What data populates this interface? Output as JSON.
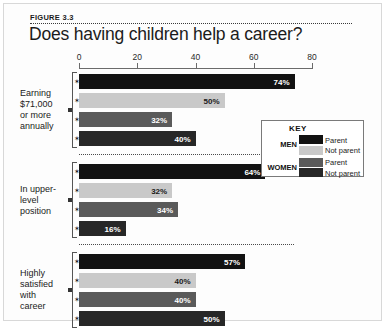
{
  "figure": {
    "number_label": "FIGURE 3.3",
    "title": "Does having children help a career?"
  },
  "key": {
    "title": "KEY",
    "groups": [
      {
        "label": "MEN",
        "entries": [
          {
            "text": "Parent",
            "color": "#121212"
          },
          {
            "text": "Not parent",
            "color": "#c9c9c9"
          }
        ]
      },
      {
        "label": "WOMEN",
        "entries": [
          {
            "text": "Parent",
            "color": "#5a5a5a"
          },
          {
            "text": "Not parent",
            "color": "#272727"
          }
        ]
      }
    ]
  },
  "chart_data": {
    "type": "bar",
    "title": "Does having children help a career?",
    "orientation": "horizontal",
    "xlabel": "",
    "ylabel": "",
    "xlim": [
      0,
      80
    ],
    "xticks": [
      0,
      20,
      40,
      60,
      80
    ],
    "xtick_labels": [
      "0",
      "20",
      "40",
      "60",
      "80"
    ],
    "grid": false,
    "legend_position": "right-middle",
    "value_suffix": "%",
    "categories": [
      "Earning $71,000 or more annually",
      "In upper-level position",
      "Highly satisfied with career"
    ],
    "category_labels_wrapped": [
      "Earning\n$71,000\nor more\nannually",
      "In upper-\nlevel\nposition",
      "Highly\nsatisfied\nwith\ncareer"
    ],
    "series": [
      {
        "name": "Men Parent",
        "color": "#121212",
        "label_color": "#ffffff",
        "values": [
          74,
          64,
          57
        ]
      },
      {
        "name": "Men Not parent",
        "color": "#c9c9c9",
        "label_color": "#1a1a1a",
        "values": [
          50,
          32,
          40
        ]
      },
      {
        "name": "Women Parent",
        "color": "#5a5a5a",
        "label_color": "#ffffff",
        "values": [
          32,
          34,
          40
        ]
      },
      {
        "name": "Women Not parent",
        "color": "#272727",
        "label_color": "#ffffff",
        "values": [
          40,
          16,
          50
        ]
      }
    ],
    "groups": [
      {
        "label": "Earning\n$71,000\nor more\nannually",
        "bars": [
          {
            "series": "Men Parent",
            "value": 74,
            "value_label": "74%",
            "color": "#121212",
            "label_color": "#ffffff"
          },
          {
            "series": "Men Not parent",
            "value": 50,
            "value_label": "50%",
            "color": "#c9c9c9",
            "label_color": "#1a1a1a"
          },
          {
            "series": "Women Parent",
            "value": 32,
            "value_label": "32%",
            "color": "#5a5a5a",
            "label_color": "#ffffff"
          },
          {
            "series": "Women Not parent",
            "value": 40,
            "value_label": "40%",
            "color": "#272727",
            "label_color": "#ffffff"
          }
        ]
      },
      {
        "label": "In upper-\nlevel\nposition",
        "bars": [
          {
            "series": "Men Parent",
            "value": 64,
            "value_label": "64%",
            "color": "#121212",
            "label_color": "#ffffff"
          },
          {
            "series": "Men Not parent",
            "value": 32,
            "value_label": "32%",
            "color": "#c9c9c9",
            "label_color": "#1a1a1a"
          },
          {
            "series": "Women Parent",
            "value": 34,
            "value_label": "34%",
            "color": "#5a5a5a",
            "label_color": "#ffffff"
          },
          {
            "series": "Women Not parent",
            "value": 16,
            "value_label": "16%",
            "color": "#272727",
            "label_color": "#ffffff"
          }
        ]
      },
      {
        "label": "Highly\nsatisfied\nwith\ncareer",
        "bars": [
          {
            "series": "Men Parent",
            "value": 57,
            "value_label": "57%",
            "color": "#121212",
            "label_color": "#ffffff"
          },
          {
            "series": "Men Not parent",
            "value": 40,
            "value_label": "40%",
            "color": "#c9c9c9",
            "label_color": "#1a1a1a"
          },
          {
            "series": "Women Parent",
            "value": 40,
            "value_label": "40%",
            "color": "#5a5a5a",
            "label_color": "#ffffff"
          },
          {
            "series": "Women Not parent",
            "value": 50,
            "value_label": "50%",
            "color": "#272727",
            "label_color": "#ffffff"
          }
        ]
      }
    ]
  }
}
